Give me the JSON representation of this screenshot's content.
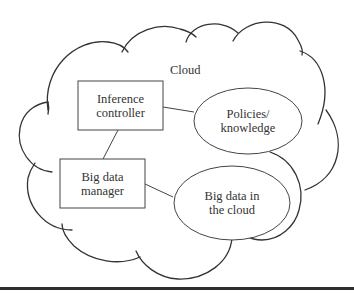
{
  "diagram": {
    "container_label": "Cloud",
    "nodes": [
      {
        "id": "inference-controller",
        "shape": "rectangle",
        "lines": [
          "Inference",
          "controller"
        ]
      },
      {
        "id": "policies-knowledge",
        "shape": "ellipse",
        "lines": [
          "Policies/",
          "knowledge"
        ]
      },
      {
        "id": "big-data-manager",
        "shape": "rectangle",
        "lines": [
          "Big data",
          "manager"
        ]
      },
      {
        "id": "big-data-in-cloud",
        "shape": "ellipse",
        "lines": [
          "Big data in",
          "the cloud"
        ]
      }
    ],
    "edges": [
      {
        "from": "inference-controller",
        "to": "policies-knowledge"
      },
      {
        "from": "inference-controller",
        "to": "big-data-manager"
      },
      {
        "from": "big-data-manager",
        "to": "big-data-in-cloud"
      }
    ],
    "colors": {
      "stroke": "#333333",
      "text": "#333333",
      "background": "#ffffff"
    }
  }
}
